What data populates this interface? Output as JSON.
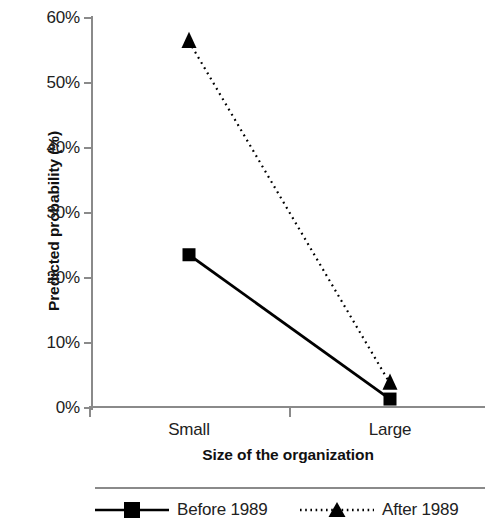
{
  "chart_data": {
    "type": "line",
    "title": "",
    "subtitle": "",
    "xlabel": "Size of the organization",
    "ylabel": "Predicted probability (%)",
    "categories": [
      "Small",
      "Large"
    ],
    "series": [
      {
        "name": "Before 1989",
        "values": [
          23.5,
          1.3
        ],
        "marker": "square",
        "line_style": "solid",
        "color": "#000000"
      },
      {
        "name": "After 1989",
        "values": [
          56.3,
          3.7
        ],
        "marker": "triangle",
        "line_style": "dotted",
        "color": "#000000"
      }
    ],
    "ylim": [
      0,
      60
    ],
    "ytick_values": [
      0,
      10,
      20,
      30,
      40,
      50,
      60
    ],
    "ytick_labels": [
      "0%",
      "10%",
      "20%",
      "30%",
      "40%",
      "50%",
      "60%"
    ],
    "xtick_labels": [
      "Small",
      "Large"
    ],
    "grid": false,
    "legend_position": "bottom",
    "legend_entries": [
      "Before 1989",
      "After 1989"
    ],
    "axis_color": "#8a8a8a"
  },
  "axes": {
    "y": {
      "title": "Predicted probability (%)",
      "ticks": [
        {
          "label": "60%",
          "value": 60
        },
        {
          "label": "50%",
          "value": 50
        },
        {
          "label": "40%",
          "value": 40
        },
        {
          "label": "30%",
          "value": 30
        },
        {
          "label": "20%",
          "value": 20
        },
        {
          "label": "10%",
          "value": 10
        },
        {
          "label": "0%",
          "value": 0
        }
      ]
    },
    "x": {
      "title": "Size of the organization",
      "ticks": [
        {
          "label": "Small"
        },
        {
          "label": "Large"
        }
      ]
    }
  },
  "legend": {
    "items": [
      {
        "label": "Before 1989",
        "marker": "square-marker",
        "style": "solid"
      },
      {
        "label": "After 1989",
        "marker": "triangle-marker",
        "style": "dotted"
      }
    ]
  }
}
